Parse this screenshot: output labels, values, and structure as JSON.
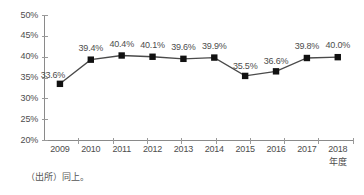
{
  "chart_data": {
    "type": "line",
    "title": "",
    "xlabel": "年度",
    "ylabel": "",
    "categories": [
      "2009",
      "2010",
      "2011",
      "2012",
      "2013",
      "2014",
      "2015",
      "2016",
      "2017",
      "2018"
    ],
    "values": [
      33.6,
      39.4,
      40.4,
      40.1,
      39.6,
      39.9,
      35.5,
      36.6,
      39.8,
      40.0
    ],
    "point_labels": [
      "33.6%",
      "39.4%",
      "40.4%",
      "40.1%",
      "39.6%",
      "39.9%",
      "35.5%",
      "36.6%",
      "39.8%",
      "40.0%"
    ],
    "ylim": [
      20,
      50
    ],
    "y_ticks": [
      50,
      45,
      40,
      35,
      30,
      25,
      20
    ],
    "y_tick_labels": [
      "50%",
      "45%",
      "40%",
      "35%",
      "30%",
      "25%",
      "20%"
    ],
    "grid": false,
    "legend": "none",
    "series": [
      {
        "name": "",
        "values": [
          33.6,
          39.4,
          40.4,
          40.1,
          39.6,
          39.9,
          35.5,
          36.6,
          39.8,
          40.0
        ],
        "marker": "square",
        "marker_color": "#111111",
        "line_color": "#4a4a4a"
      }
    ]
  },
  "source_note": "（出所）同上。",
  "colors": {
    "background": "#ffffff",
    "axis": "#8a8a8a",
    "text": "#4d4d4d",
    "marker": "#111111",
    "line": "#4a4a4a"
  }
}
